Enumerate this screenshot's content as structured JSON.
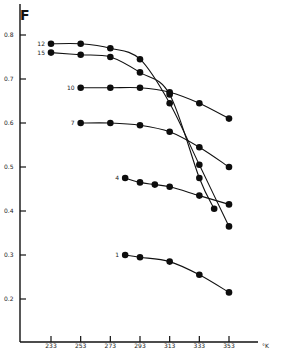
{
  "chart_data": {
    "type": "line",
    "title": "",
    "ylabel": "F",
    "xlabel": "°K",
    "xlim": [
      223,
      363
    ],
    "ylim": [
      0.1,
      0.82
    ],
    "grid": false,
    "legend_position": "inline-left-of-series",
    "x_ticks": [
      233,
      253,
      273,
      293,
      313,
      333,
      353
    ],
    "x_tick_labels": [
      "233",
      "253",
      "273",
      "293",
      "313",
      "333",
      "353"
    ],
    "y_ticks": [
      0.2,
      0.3,
      0.4,
      0.5,
      0.6,
      0.7,
      0.8
    ],
    "y_tick_labels": [
      "0.2",
      "0.3",
      "0.4",
      "0.5",
      "0.6",
      "0.7",
      "0.8"
    ],
    "series": [
      {
        "name": "12",
        "x": [
          233,
          253,
          273,
          293,
          313,
          333,
          353
        ],
        "values": [
          0.78,
          0.78,
          0.77,
          0.745,
          0.645,
          0.505,
          0.365
        ]
      },
      {
        "name": "15",
        "x": [
          233,
          253,
          273,
          293,
          313,
          333,
          343
        ],
        "values": [
          0.76,
          0.755,
          0.75,
          0.715,
          0.665,
          0.475,
          0.405
        ]
      },
      {
        "name": "10",
        "x": [
          253,
          273,
          293,
          313,
          333,
          353
        ],
        "values": [
          0.68,
          0.68,
          0.68,
          0.67,
          0.645,
          0.61
        ]
      },
      {
        "name": "7",
        "x": [
          253,
          273,
          293,
          313,
          333,
          353
        ],
        "values": [
          0.6,
          0.6,
          0.595,
          0.58,
          0.545,
          0.5
        ]
      },
      {
        "name": "4",
        "x": [
          283,
          293,
          303,
          313,
          333,
          353
        ],
        "values": [
          0.475,
          0.465,
          0.46,
          0.455,
          0.435,
          0.415
        ]
      },
      {
        "name": "1",
        "x": [
          283,
          293,
          313,
          333,
          353
        ],
        "values": [
          0.3,
          0.295,
          0.285,
          0.255,
          0.215
        ]
      }
    ]
  }
}
